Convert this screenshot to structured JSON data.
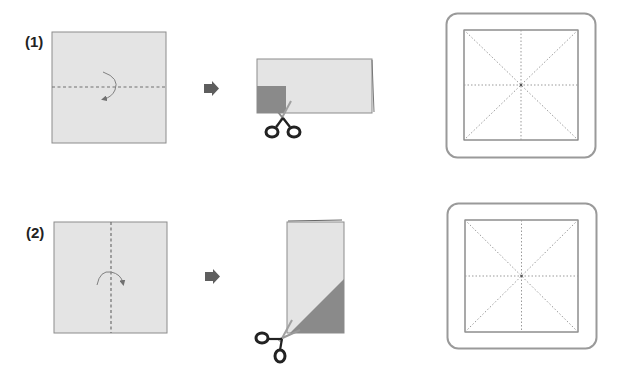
{
  "steps": [
    {
      "label": "(1)",
      "fold": "horizontal",
      "cut_shape": "square-corner",
      "result": "grid-with-diagonals"
    },
    {
      "label": "(2)",
      "fold": "vertical",
      "cut_shape": "diagonal-triangle",
      "result": "grid-with-diagonals"
    }
  ],
  "icons": {
    "next_arrow": "arrow-right-icon",
    "scissors": "scissors-icon",
    "fold_arrow": "curved-arrow-icon"
  },
  "colors": {
    "paper": "#e4e4e4",
    "paper_border": "#8c8c8c",
    "cut_region": "#8a8a8a",
    "arrow": "#5e5e5e",
    "scissors": "#222222",
    "frame": "#9a9a9a",
    "dotted": "#9a9a9a"
  }
}
